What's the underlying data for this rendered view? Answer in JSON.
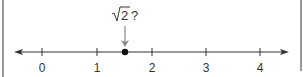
{
  "diagram": {
    "type": "number-line",
    "ticks": [
      {
        "value": 0,
        "label": "0",
        "x": 42
      },
      {
        "value": 1,
        "label": "1",
        "x": 97
      },
      {
        "value": 2,
        "label": "2",
        "x": 152
      },
      {
        "value": 3,
        "label": "3",
        "x": 206
      },
      {
        "value": 4,
        "label": "4",
        "x": 260
      }
    ],
    "point": {
      "value": 1.5,
      "x": 125
    },
    "annotation": {
      "radicand": "2",
      "suffix": "?",
      "text": "√2 ?"
    },
    "colors": {
      "line": "#333333",
      "arrow": "#888888",
      "frame": "#9a9a9a"
    }
  }
}
